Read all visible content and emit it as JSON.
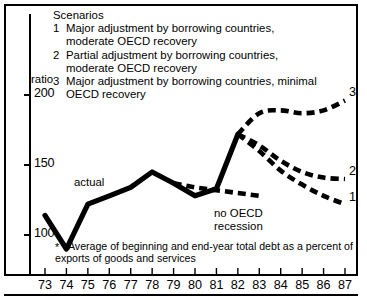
{
  "figure": {
    "axis_unit_label": "ratio",
    "footnote_marker": "*",
    "footnote": "Average of beginning and end-year  total debt as a percent of exports of goods and services"
  },
  "legend": {
    "title": "Scenarios",
    "items": [
      {
        "num": "1",
        "text": "Major adjustment by borrowing countries, moderate OECD recovery"
      },
      {
        "num": "2",
        "text": "Partial adjustment by borrowing countries, moderate OECD recovery"
      },
      {
        "num": "3",
        "text": "Major adjustment by borrowing countries, minimal OECD recovery"
      }
    ]
  },
  "annotations": {
    "actual": "actual",
    "no_oecd_recession": "no OECD\nrecession",
    "no_oecd_recession_line1": "no OECD",
    "no_oecd_recession_line2": "recession",
    "end_label_1": "1",
    "end_label_2": "2",
    "end_label_3": "3"
  },
  "colors": {
    "ink": "#000000",
    "background": "#ffffff"
  },
  "chart_data": {
    "type": "line",
    "title": "",
    "subtitle": "",
    "xlabel": "",
    "ylabel": "ratio",
    "xlim": [
      73,
      87
    ],
    "ylim": [
      85,
      205
    ],
    "yticks": [
      100,
      150,
      200
    ],
    "ytick_labels": [
      "100",
      "150",
      "200"
    ],
    "xticks": [
      73,
      74,
      75,
      76,
      77,
      78,
      79,
      80,
      81,
      82,
      83,
      84,
      85,
      86,
      87
    ],
    "xtick_labels": [
      "73",
      "74",
      "75",
      "76",
      "77",
      "78",
      "79",
      "80",
      "81",
      "82",
      "83",
      "84",
      "85",
      "86",
      "87"
    ],
    "grid": false,
    "legend_position": "top-left",
    "series": [
      {
        "name": "actual",
        "style": "solid",
        "x": [
          73,
          74,
          75,
          76,
          77,
          78,
          79,
          80,
          81,
          82
        ],
        "values": [
          114,
          90,
          122,
          128,
          134,
          145,
          137,
          128,
          133,
          172
        ]
      },
      {
        "name": "no OECD recession",
        "style": "dashed",
        "x": [
          79,
          80,
          81,
          82,
          83
        ],
        "values": [
          137,
          134,
          132,
          130,
          128
        ]
      },
      {
        "name": "1",
        "style": "dashed",
        "x": [
          82,
          83,
          84,
          85,
          86,
          87
        ],
        "values": [
          172,
          160,
          146,
          136,
          128,
          122
        ]
      },
      {
        "name": "2",
        "style": "dashed",
        "x": [
          82,
          83,
          84,
          85,
          86,
          87
        ],
        "values": [
          172,
          164,
          153,
          145,
          141,
          140
        ]
      },
      {
        "name": "3",
        "style": "dashed",
        "x": [
          82,
          83,
          84,
          85,
          86,
          87
        ],
        "values": [
          172,
          187,
          189,
          187,
          189,
          196
        ]
      }
    ]
  }
}
